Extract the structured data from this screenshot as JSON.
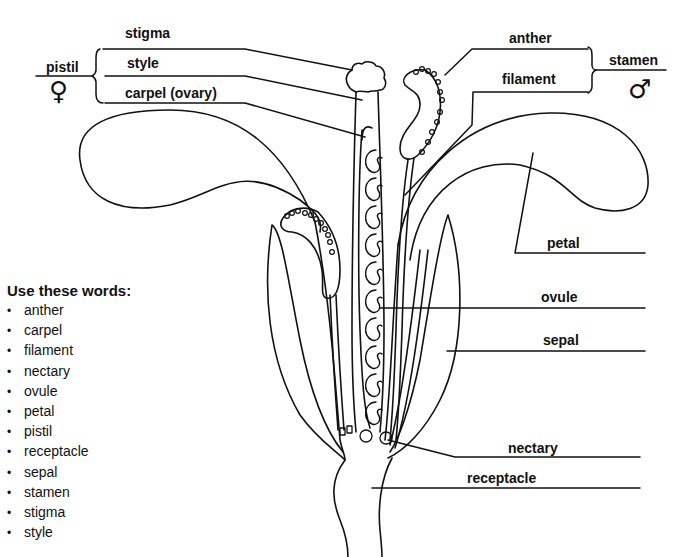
{
  "diagram": {
    "labels": {
      "stigma": "stigma",
      "style": "style",
      "carpel": "carpel (ovary)",
      "pistil": "pistil",
      "pistil_symbol": "♀",
      "anther": "anther",
      "filament": "filament",
      "stamen": "stamen",
      "stamen_symbol": "♂",
      "petal": "petal",
      "ovule": "ovule",
      "sepal": "sepal",
      "nectary": "nectary",
      "receptacle": "receptacle"
    }
  },
  "word_bank": {
    "heading": "Use these words:",
    "words": [
      "anther",
      "carpel",
      "filament",
      "nectary",
      "ovule",
      "petal",
      "pistil",
      "receptacle",
      "sepal",
      "stamen",
      "stigma",
      "style"
    ]
  }
}
